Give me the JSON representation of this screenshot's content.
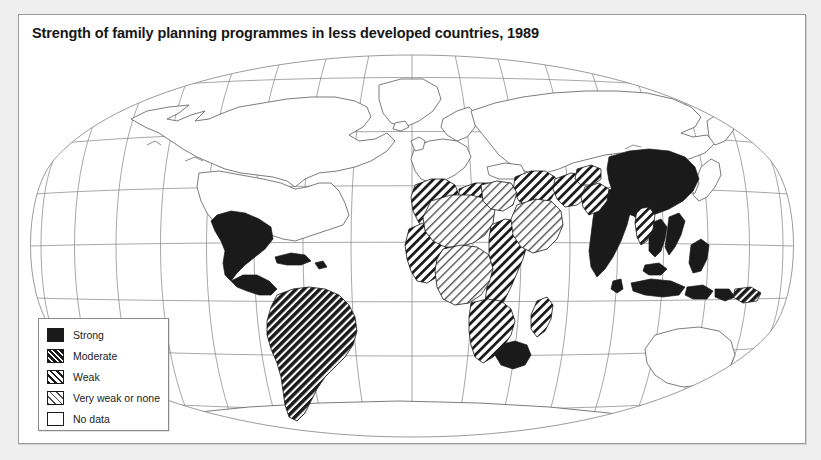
{
  "figure": {
    "title": "Strength of family planning programmes in less developed countries, 1989",
    "background_color": "#efefef",
    "panel_color": "#ffffff",
    "border_color": "#9a9a9a"
  },
  "map": {
    "projection": "globe-graticule",
    "graticule": {
      "meridian_count": 17,
      "parallel_count": 9,
      "line_color": "#8f8f8f"
    },
    "coastline_color": "#5a5a5a",
    "ocean_color": "#ffffff"
  },
  "legend": {
    "title": "",
    "items": [
      {
        "label": "Strong",
        "pattern": "solid-black",
        "swatch_class": "sw-strong",
        "color": "#1a1a1a"
      },
      {
        "label": "Moderate",
        "pattern": "hatch-dense",
        "swatch_class": "sw-moderate",
        "color": "#1a1a1a"
      },
      {
        "label": "Weak",
        "pattern": "hatch-medium",
        "swatch_class": "sw-weak",
        "color": "#1a1a1a"
      },
      {
        "label": "Very weak or none",
        "pattern": "hatch-light",
        "swatch_class": "sw-veryweak",
        "color": "#4d4d4d"
      },
      {
        "label": "No data",
        "pattern": "none",
        "swatch_class": "sw-nodata",
        "color": "#ffffff"
      }
    ]
  },
  "regions": [
    {
      "name": "Mexico",
      "category": "Strong"
    },
    {
      "name": "Central America",
      "category": "Strong"
    },
    {
      "name": "Caribbean",
      "category": "Strong"
    },
    {
      "name": "South America",
      "category": "Moderate"
    },
    {
      "name": "North Africa",
      "category": "Weak"
    },
    {
      "name": "Sahel",
      "category": "Very weak or none"
    },
    {
      "name": "West Africa",
      "category": "Weak"
    },
    {
      "name": "Central Africa",
      "category": "Very weak or none"
    },
    {
      "name": "East Africa",
      "category": "Weak"
    },
    {
      "name": "Southern Africa",
      "category": "Weak"
    },
    {
      "name": "South Africa",
      "category": "Strong"
    },
    {
      "name": "Madagascar",
      "category": "Weak"
    },
    {
      "name": "Arabian Peninsula",
      "category": "Very weak or none"
    },
    {
      "name": "Middle East",
      "category": "Weak"
    },
    {
      "name": "Iran",
      "category": "Weak"
    },
    {
      "name": "Pakistan",
      "category": "Weak"
    },
    {
      "name": "India",
      "category": "Strong"
    },
    {
      "name": "Bangladesh",
      "category": "Strong"
    },
    {
      "name": "Sri Lanka",
      "category": "Strong"
    },
    {
      "name": "China",
      "category": "Strong"
    },
    {
      "name": "Mongolia",
      "category": "No data"
    },
    {
      "name": "Myanmar",
      "category": "Weak"
    },
    {
      "name": "Thailand",
      "category": "Strong"
    },
    {
      "name": "Vietnam",
      "category": "Strong"
    },
    {
      "name": "Indonesia",
      "category": "Strong"
    },
    {
      "name": "Philippines",
      "category": "Strong"
    },
    {
      "name": "Papua New Guinea",
      "category": "Moderate"
    },
    {
      "name": "United States",
      "category": "No data"
    },
    {
      "name": "Canada",
      "category": "No data"
    },
    {
      "name": "Europe",
      "category": "No data"
    },
    {
      "name": "Soviet Union",
      "category": "No data"
    },
    {
      "name": "Japan",
      "category": "No data"
    },
    {
      "name": "Australia",
      "category": "No data"
    },
    {
      "name": "New Zealand",
      "category": "No data"
    },
    {
      "name": "Antarctica",
      "category": "No data"
    }
  ]
}
